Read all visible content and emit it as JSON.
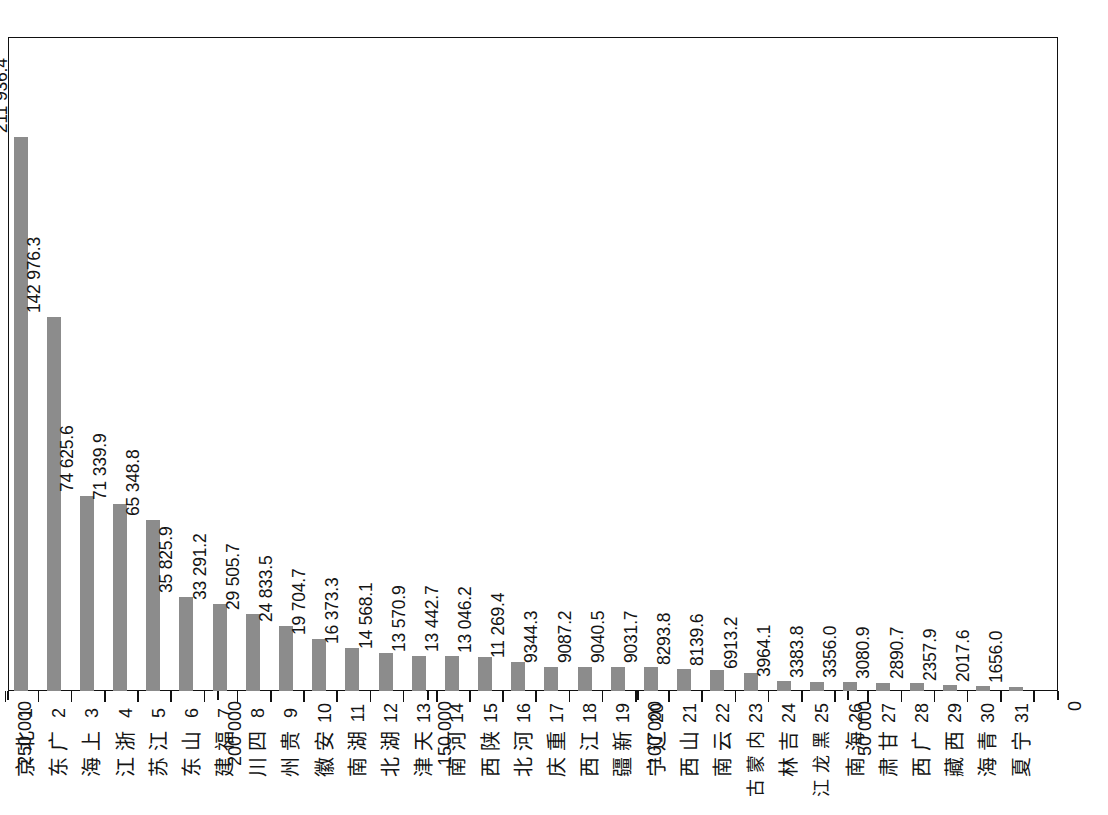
{
  "chart_data": {
    "type": "bar",
    "orientation": "vertical-rotated-90ccw",
    "title": "",
    "subtitle": "",
    "xlabel": "",
    "ylabel": "",
    "grid": false,
    "legend": null,
    "value_axis": {
      "min": 0,
      "max": 250000,
      "ticks": [
        0,
        50000,
        100000,
        150000,
        200000,
        250000
      ],
      "tick_labels": [
        "0",
        "50 000",
        "100 000",
        "150 000",
        "200 000",
        "250 000"
      ],
      "position": "right-to-left"
    },
    "categories": [
      "北京",
      "广东",
      "上海",
      "浙江",
      "江苏",
      "山东",
      "福建",
      "四川",
      "贵州",
      "安徽",
      "湖南",
      "湖北",
      "天津",
      "河南",
      "陕西",
      "河北",
      "重庆",
      "江西",
      "新疆",
      "辽宁",
      "山西",
      "云南",
      "内蒙古",
      "吉林",
      "黑龙江",
      "海南",
      "甘肃",
      "广西",
      "西藏",
      "青海",
      "宁夏"
    ],
    "ranks": [
      "1",
      "2",
      "3",
      "4",
      "5",
      "6",
      "7",
      "8",
      "9",
      "10",
      "11",
      "12",
      "13",
      "14",
      "15",
      "16",
      "17",
      "18",
      "19",
      "20",
      "21",
      "22",
      "23",
      "24",
      "25",
      "26",
      "27",
      "28",
      "29",
      "30",
      "31"
    ],
    "values": [
      211936.4,
      142976.3,
      74625.6,
      71339.9,
      65348.8,
      35825.9,
      33291.2,
      29505.7,
      24833.5,
      19704.7,
      16373.3,
      14568.1,
      13570.9,
      13442.7,
      13046.2,
      11269.4,
      9344.3,
      9087.2,
      9040.5,
      9031.7,
      8293.8,
      8139.6,
      6913.2,
      3964.1,
      3383.8,
      3356.0,
      3080.9,
      2890.7,
      2357.9,
      2017.6,
      1656.0
    ],
    "value_labels": [
      "211 936.4",
      "142 976.3",
      "74 625.6",
      "71 339.9",
      "65 348.8",
      "35 825.9",
      "33 291.2",
      "29 505.7",
      "24 833.5",
      "19 704.7",
      "16 373.3",
      "14 568.1",
      "13 570.9",
      "13 442.7",
      "13 046.2",
      "11 269.4",
      "9344.3",
      "9087.2",
      "9040.5",
      "9031.7",
      "8293.8",
      "8139.6",
      "6913.2",
      "3964.1",
      "3383.8",
      "3356.0",
      "3080.9",
      "2890.7",
      "2357.9",
      "2017.6",
      "1656.0"
    ],
    "bar_color": "#8c8c8c",
    "axis_color": "#111111",
    "background": "#ffffff"
  }
}
